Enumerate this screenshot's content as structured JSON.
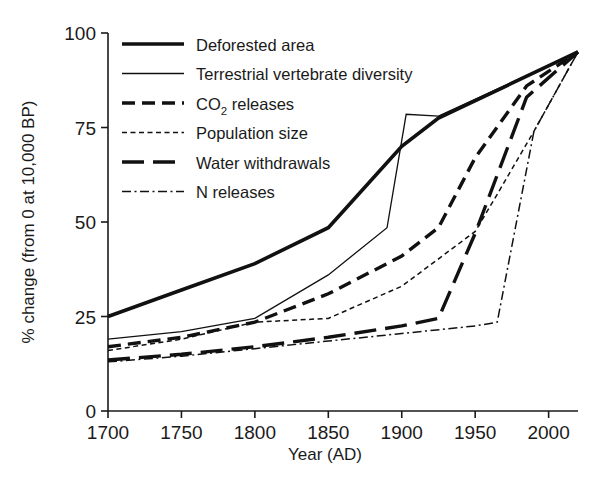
{
  "figure": {
    "background": "#ffffff",
    "ink_color": "#111111"
  },
  "chart_data": {
    "type": "line",
    "title": "",
    "xlabel": "Year (AD)",
    "ylabel": "% change (from 0 at 10,000 BP)",
    "xlim": [
      1700,
      2020
    ],
    "ylim": [
      0,
      100
    ],
    "grid": false,
    "legend_position": "upper-left",
    "xticks": [
      1700,
      1750,
      1800,
      1850,
      1900,
      1950,
      2000
    ],
    "xticklabels": [
      "1700",
      "1750",
      "1800",
      "1850",
      "1900",
      "1950",
      "2000"
    ],
    "yticks": [
      0,
      25,
      50,
      75,
      100
    ],
    "yticklabels": [
      "0",
      "25",
      "50",
      "75",
      "100"
    ],
    "series": [
      {
        "name": "Deforested area",
        "label": "Deforested area",
        "label_prefix": "Deforested area",
        "label_sub": "",
        "label_suffix": "",
        "style": "solid-thick",
        "stroke_width": 3.6,
        "dasharray": "none",
        "x": [
          1700,
          1750,
          1800,
          1850,
          1900,
          1925,
          2020
        ],
        "y": [
          25,
          32,
          39,
          48.5,
          70,
          77.5,
          95
        ]
      },
      {
        "name": "Terrestrial vertebrate diversity",
        "label": "Terrestrial vertebrate diversity",
        "label_prefix": "Terrestrial vertebrate diversity",
        "label_sub": "",
        "label_suffix": "",
        "style": "solid-thin",
        "stroke_width": 1.3,
        "dasharray": "none",
        "x": [
          1700,
          1750,
          1800,
          1850,
          1890,
          1903,
          1925,
          2020
        ],
        "y": [
          19,
          21,
          24.5,
          36,
          48.5,
          78.5,
          78,
          95
        ]
      },
      {
        "name": "CO2 releases",
        "label": "CO2 releases",
        "label_prefix": "CO",
        "label_sub": "2",
        "label_suffix": " releases",
        "style": "dashed-thick",
        "stroke_width": 3.4,
        "dasharray": "13,7",
        "x": [
          1700,
          1750,
          1800,
          1850,
          1900,
          1925,
          1950,
          1985,
          2020
        ],
        "y": [
          17,
          19.5,
          23.5,
          31,
          41,
          48.5,
          67,
          86,
          95
        ]
      },
      {
        "name": "Population size",
        "label": "Population size",
        "label_prefix": "Population size",
        "label_sub": "",
        "label_suffix": "",
        "style": "dotted-thin",
        "stroke_width": 1.5,
        "dasharray": "5,3.5",
        "x": [
          1700,
          1750,
          1800,
          1850,
          1900,
          1950,
          1963,
          1990,
          2020
        ],
        "y": [
          16,
          19,
          23.5,
          24.5,
          33,
          47.5,
          56,
          74,
          95
        ]
      },
      {
        "name": "Water withdrawals",
        "label": "Water withdrawals",
        "label_prefix": "Water withdrawals",
        "label_sub": "",
        "label_suffix": "",
        "style": "longdash-thick",
        "stroke_width": 3.4,
        "dasharray": "22,9",
        "x": [
          1700,
          1750,
          1800,
          1850,
          1900,
          1925,
          1950,
          1985,
          2020
        ],
        "y": [
          13.5,
          15,
          17,
          19.5,
          22.5,
          24.5,
          47,
          83,
          95
        ]
      },
      {
        "name": "N releases",
        "label": "N releases",
        "label_prefix": "N releases",
        "label_sub": "",
        "label_suffix": "",
        "style": "dashdot-thin",
        "stroke_width": 1.5,
        "dasharray": "9,3.5,2,3.5",
        "x": [
          1700,
          1750,
          1800,
          1850,
          1900,
          1950,
          1965,
          1990,
          2020
        ],
        "y": [
          13,
          14.5,
          16.5,
          18.5,
          20.5,
          22.5,
          23.5,
          74,
          95
        ]
      }
    ]
  }
}
